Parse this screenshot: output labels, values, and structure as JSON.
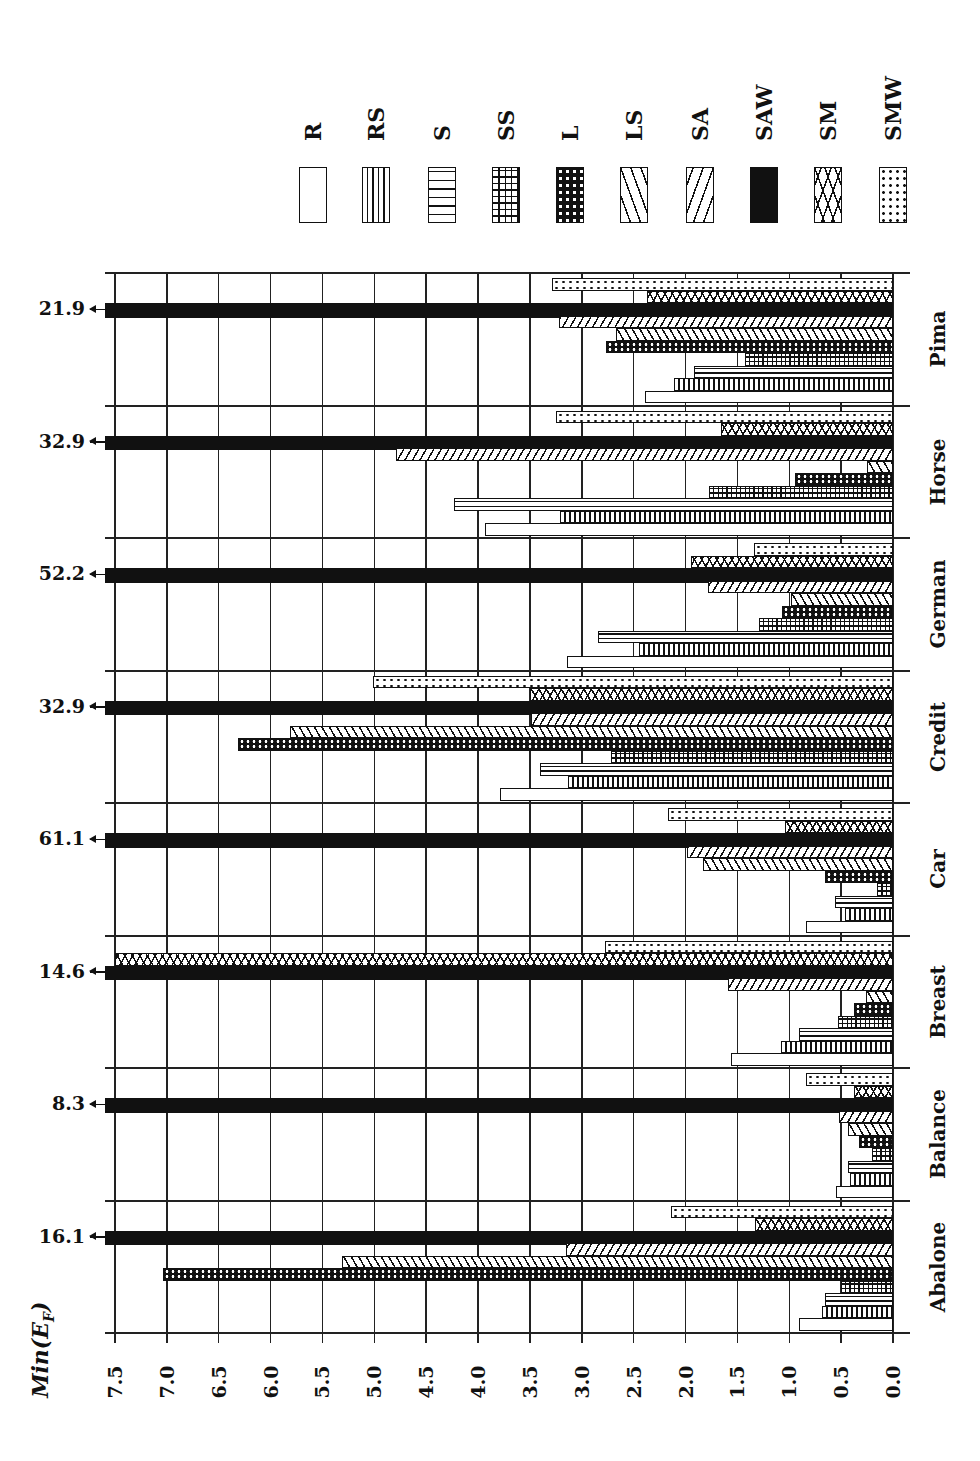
{
  "chart_data": {
    "type": "bar",
    "orientation": "horizontal (figure rotated 90 degrees; value axis runs right-to-left along bottom)",
    "title": "",
    "ylabel": "Min(E_F)",
    "xlabel": "",
    "ylim": [
      0.0,
      7.5
    ],
    "axis_ticks": [
      "7.5",
      "7.0",
      "6.5",
      "6.0",
      "5.5",
      "5.0",
      "4.5",
      "4.0",
      "3.5",
      "3.0",
      "2.5",
      "2.0",
      "1.5",
      "1.0",
      "0.5",
      "0.0"
    ],
    "grid": true,
    "legend_position": "top",
    "legend": [
      "R",
      "RS",
      "S",
      "SS",
      "L",
      "LS",
      "SA",
      "SAW",
      "SM",
      "SMW"
    ],
    "categories": [
      "Abalone",
      "Balance",
      "Breast",
      "Car",
      "Credit",
      "German",
      "Horse",
      "Pima"
    ],
    "series": [
      {
        "name": "R",
        "values": [
          0.91,
          0.55,
          1.56,
          0.84,
          3.79,
          3.14,
          3.93,
          2.39
        ]
      },
      {
        "name": "RS",
        "values": [
          0.68,
          0.41,
          1.08,
          0.46,
          3.13,
          2.45,
          3.21,
          2.11
        ]
      },
      {
        "name": "S",
        "values": [
          0.66,
          0.43,
          0.91,
          0.56,
          3.4,
          2.84,
          4.23,
          1.92
        ]
      },
      {
        "name": "SS",
        "values": [
          0.5,
          0.2,
          0.53,
          0.15,
          2.72,
          1.29,
          1.77,
          1.43
        ]
      },
      {
        "name": "L",
        "values": [
          7.04,
          0.33,
          0.38,
          0.66,
          6.31,
          1.07,
          0.94,
          2.77
        ]
      },
      {
        "name": "LS",
        "values": [
          5.31,
          0.43,
          0.26,
          1.83,
          5.81,
          0.98,
          0.25,
          2.67
        ]
      },
      {
        "name": "SA",
        "values": [
          3.15,
          0.52,
          1.59,
          1.99,
          3.49,
          1.78,
          4.79,
          3.22
        ]
      },
      {
        "name": "SAW",
        "values": [
          16.1,
          8.3,
          14.6,
          61.1,
          32.9,
          52.2,
          32.9,
          21.9
        ]
      },
      {
        "name": "SM",
        "values": [
          1.33,
          0.38,
          7.5,
          1.04,
          3.5,
          1.95,
          1.66,
          2.37
        ]
      },
      {
        "name": "SMW",
        "values": [
          2.14,
          0.84,
          2.78,
          2.17,
          5.01,
          1.34,
          3.25,
          3.29
        ]
      }
    ],
    "annotations": [
      {
        "category": "Pima",
        "series": "SAW",
        "text": "21.9"
      },
      {
        "category": "Horse",
        "series": "SAW",
        "text": "32.9"
      },
      {
        "category": "German",
        "series": "SAW",
        "text": "52.2"
      },
      {
        "category": "Credit",
        "series": "SAW",
        "text": "32.9"
      },
      {
        "category": "Car",
        "series": "SAW",
        "text": "61.1"
      },
      {
        "category": "Breast",
        "series": "SAW",
        "text": "14.6"
      },
      {
        "category": "Balance",
        "series": "SAW",
        "text": "8.3"
      },
      {
        "category": "Abalone",
        "series": "SAW",
        "text": "16.1"
      }
    ]
  },
  "axis": {
    "label": "Min(E_F)",
    "label_main": "Min(E",
    "label_sub": "F",
    "label_close": ")"
  },
  "layout": {
    "zero_x": 893,
    "max_x": 115,
    "max_value": 7.5,
    "plot_top": 273,
    "plot_bottom": 1333,
    "group_order_top_to_bottom": [
      "Pima",
      "Horse",
      "German",
      "Credit",
      "Car",
      "Breast",
      "Balance",
      "Abalone"
    ],
    "group_height": 132.5
  }
}
